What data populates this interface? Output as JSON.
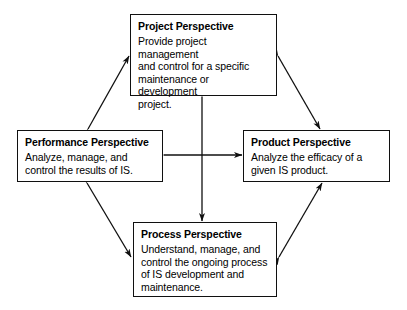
{
  "diagram": {
    "stroke_color": "#101010",
    "background_color": "#ffffff",
    "nodes": [
      {
        "id": "project",
        "title": "Project Perspective",
        "body": "Provide project management\nand control for a specific\nmaintenance or development\nproject."
      },
      {
        "id": "performance",
        "title": "Performance Perspective",
        "body": "Analyze, manage, and\ncontrol the results of IS."
      },
      {
        "id": "product",
        "title": "Product Perspective",
        "body": "Analyze the efficacy of a\ngiven IS product."
      },
      {
        "id": "process",
        "title": "Process Perspective",
        "body": "Understand, manage, and\ncontrol the ongoing process\nof IS development and\nmaintenance."
      }
    ],
    "connectors": [
      {
        "id": "performance-project",
        "from": "performance",
        "to": "project",
        "style": "double-headed-diagonal"
      },
      {
        "id": "project-product",
        "from": "project",
        "to": "product",
        "style": "double-headed-diagonal"
      },
      {
        "id": "performance-process",
        "from": "performance",
        "to": "process",
        "style": "double-headed-diagonal"
      },
      {
        "id": "process-product",
        "from": "process",
        "to": "product",
        "style": "double-headed-diagonal"
      },
      {
        "id": "performance-product",
        "from": "performance",
        "to": "product",
        "style": "double-headed-horizontal"
      },
      {
        "id": "project-process",
        "from": "project",
        "to": "process",
        "style": "double-headed-vertical"
      }
    ]
  }
}
